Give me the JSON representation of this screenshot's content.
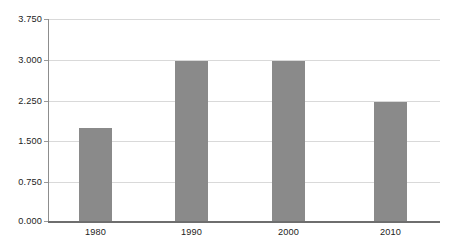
{
  "chart_data": {
    "type": "bar",
    "title": "",
    "subtitle": "",
    "xlabel": "",
    "ylabel": "",
    "categories": [
      "1980",
      "1990",
      "2000",
      "2010"
    ],
    "values": [
      1.73,
      2.97,
      2.98,
      2.21
    ],
    "series": [
      {
        "name": "",
        "values": [
          1.73,
          2.97,
          2.98,
          2.21
        ]
      }
    ],
    "ylim": [
      0.0,
      3.75
    ],
    "ytick_labels": [
      "3.750",
      "3.000",
      "2.250",
      "1.500",
      "0.750",
      "0.000"
    ],
    "ytick_values": [
      3.75,
      3.0,
      2.25,
      1.5,
      0.75,
      0.0
    ],
    "ytick_interval": 0.75,
    "grid": "horizontal",
    "legend": "none",
    "bar_color": "#8a8a8a",
    "gridline_color": "#d9d9d9",
    "axis_color": "#6e6e6e",
    "background_color": "#ffffff",
    "annotations": []
  },
  "axis": {
    "y_labels": [
      {
        "text": "3.750",
        "value": 3.75
      },
      {
        "text": "3.000",
        "value": 3.0
      },
      {
        "text": "2.250",
        "value": 2.25
      },
      {
        "text": "1.500",
        "value": 1.5
      },
      {
        "text": "0.750",
        "value": 0.75
      },
      {
        "text": "0.000",
        "value": 0.0
      }
    ],
    "x_labels": [
      {
        "text": "1980"
      },
      {
        "text": "1990"
      },
      {
        "text": "2000"
      },
      {
        "text": "2010"
      }
    ]
  }
}
